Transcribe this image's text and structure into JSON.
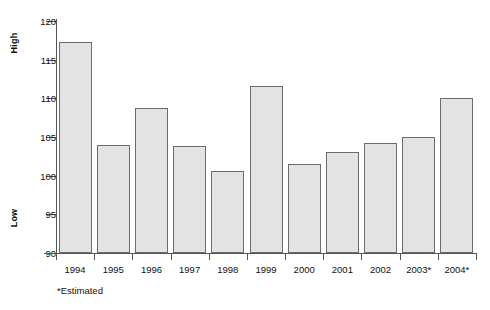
{
  "chart_data": {
    "type": "bar",
    "title": "",
    "subtitle": "",
    "xlabel": "",
    "ylabel": "",
    "ylim": [
      90,
      120
    ],
    "y_ticks": [
      90,
      95,
      100,
      105,
      110,
      115,
      120
    ],
    "grid": false,
    "legend_position": "none",
    "axis_group_labels": {
      "top": "High",
      "bottom": "Low"
    },
    "categories": [
      "1994",
      "1995",
      "1996",
      "1997",
      "1998",
      "1999",
      "2000",
      "2001",
      "2002",
      "2003*",
      "2004*"
    ],
    "values": [
      117.3,
      104.0,
      108.7,
      103.9,
      100.6,
      111.6,
      101.5,
      103.1,
      104.2,
      105.0,
      110.0
    ],
    "annotations": [
      "*Estimated"
    ],
    "series": [
      {
        "name": "Index",
        "values": [
          117.3,
          104.0,
          108.7,
          103.9,
          100.6,
          111.6,
          101.5,
          103.1,
          104.2,
          105.0,
          110.0
        ]
      }
    ]
  },
  "footnote": "*Estimated",
  "colors": {
    "bar_fill": "#e3e3e3",
    "bar_border": "#6b6b6b",
    "axis": "#555555",
    "text": "#111111",
    "background": "#ffffff"
  }
}
